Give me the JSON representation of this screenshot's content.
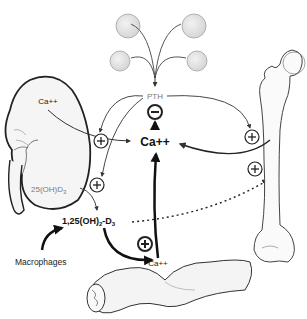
{
  "diagram": {
    "nodes": {
      "pth": "PTH",
      "calcium_center": "Ca++",
      "kidney_calcium": "Ca++",
      "vitd_25": "25(OH)D",
      "vitd_25_sub": "3",
      "vitd_125_prefix": "1,25(OH)",
      "vitd_125_sub1": "2",
      "vitd_125_mid": "-D",
      "vitd_125_sub2": "3",
      "macrophages": "Macrophages",
      "intestine_calcium": "Ca++"
    },
    "organs": [
      "parathyroid-glands",
      "kidney",
      "femur-bone",
      "intestine"
    ],
    "symbols": {
      "plus": "+",
      "minus": "−"
    },
    "colors": {
      "ink": "#1a1a1a",
      "line_gray": "#6e6e6e",
      "gland_fill": "#e4e4e4",
      "gland_stroke": "#a8a8a8",
      "organ_fill": "#f4f4f4",
      "label_gray": "#7a7a7a"
    },
    "relations": [
      {
        "from": "parathyroid-glands",
        "to": "PTH",
        "effect": "secretes"
      },
      {
        "from": "PTH",
        "to": "kidney",
        "effect": "+"
      },
      {
        "from": "PTH",
        "to": "25(OH)D3 conversion",
        "effect": "+"
      },
      {
        "from": "PTH",
        "to": "bone",
        "effect": "+"
      },
      {
        "from": "Ca++",
        "to": "PTH",
        "effect": "−"
      },
      {
        "from": "1,25(OH)2-D3",
        "to": "intestine Ca++ absorption",
        "effect": "+"
      },
      {
        "from": "1,25(OH)2-D3",
        "to": "bone",
        "effect": "+ (dotted)"
      },
      {
        "from": "Macrophages",
        "to": "1,25(OH)2-D3",
        "effect": "produces"
      }
    ]
  }
}
